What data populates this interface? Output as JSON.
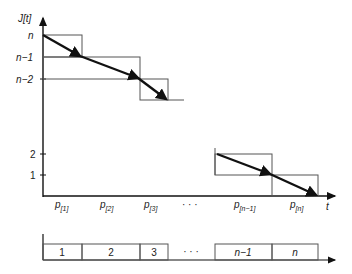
{
  "diagram": {
    "y_axis_label": "J[t]",
    "x_axis_label": "t",
    "y_ticks": [
      {
        "label": "n",
        "y": 35
      },
      {
        "label": "n−1",
        "y": 57
      },
      {
        "label": "n−2",
        "y": 79
      },
      {
        "label": "2",
        "y": 154
      },
      {
        "label": "1",
        "y": 175
      }
    ],
    "x_labels": [
      {
        "main": "p",
        "sub": "[1]",
        "x": 55
      },
      {
        "main": "p",
        "sub": "[2]",
        "x": 100
      },
      {
        "main": "p",
        "sub": "[3]",
        "x": 145
      },
      {
        "main": "· · ·",
        "sub": "",
        "x": 185
      },
      {
        "main": "p",
        "sub": "[n−1]",
        "x": 236
      },
      {
        "main": "p",
        "sub": "[n]",
        "x": 291
      }
    ],
    "ellipsis": "· · ·",
    "gantt": {
      "jobs": [
        {
          "label": "1",
          "x0": 43,
          "x1": 82
        },
        {
          "label": "2",
          "x0": 82,
          "x1": 140
        },
        {
          "label": "3",
          "x0": 140,
          "x1": 168
        },
        {
          "label": "n−1",
          "x0": 215,
          "x1": 272
        },
        {
          "label": "n",
          "x0": 272,
          "x1": 318
        }
      ],
      "ellipsis": "· · ·"
    }
  }
}
